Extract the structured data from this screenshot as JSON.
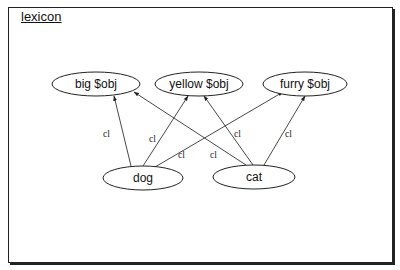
{
  "frame": {
    "title": "lexicon"
  },
  "nodes": [
    {
      "id": "big",
      "label": "big $obj",
      "cx": 96,
      "cy": 84,
      "rx": 44,
      "ry": 12
    },
    {
      "id": "yellow",
      "label": "yellow $obj",
      "cx": 199,
      "cy": 84,
      "rx": 44,
      "ry": 12
    },
    {
      "id": "furry",
      "label": "furry $obj",
      "cx": 305,
      "cy": 84,
      "rx": 42,
      "ry": 12
    },
    {
      "id": "dog",
      "label": "dog",
      "cx": 143,
      "cy": 178,
      "rx": 40,
      "ry": 12
    },
    {
      "id": "cat",
      "label": "cat",
      "cx": 254,
      "cy": 177,
      "rx": 41,
      "ry": 12
    }
  ],
  "edges": [
    {
      "from": "dog",
      "to": "big",
      "label": "cl",
      "x1": 131,
      "y1": 166,
      "x2": 114,
      "y2": 96,
      "lx": 103,
      "ly": 137
    },
    {
      "from": "dog",
      "to": "yellow",
      "label": "cl",
      "x1": 143,
      "y1": 166,
      "x2": 188,
      "y2": 96,
      "lx": 149,
      "ly": 142
    },
    {
      "from": "dog",
      "to": "furry",
      "label": "cl",
      "x1": 155,
      "y1": 167,
      "x2": 283,
      "y2": 92,
      "lx": 178,
      "ly": 158
    },
    {
      "from": "cat",
      "to": "big",
      "label": "cl",
      "x1": 246,
      "y1": 165,
      "x2": 134,
      "y2": 92,
      "lx": 210,
      "ly": 158
    },
    {
      "from": "cat",
      "to": "yellow",
      "label": "cl",
      "x1": 253,
      "y1": 165,
      "x2": 204,
      "y2": 96,
      "lx": 234,
      "ly": 137
    },
    {
      "from": "cat",
      "to": "furry",
      "label": "cl",
      "x1": 264,
      "y1": 165,
      "x2": 305,
      "y2": 96,
      "lx": 285,
      "ly": 137
    }
  ],
  "colors": {
    "stroke": "#222222",
    "background": "#ffffff"
  }
}
